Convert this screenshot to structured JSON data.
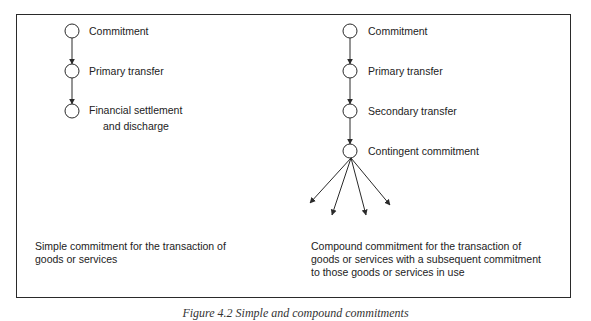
{
  "left_panel": {
    "nodes": [
      {
        "label_lines": [
          "Commitment"
        ]
      },
      {
        "label_lines": [
          "Primary transfer"
        ]
      },
      {
        "label_lines": [
          "Financial settlement",
          "and discharge"
        ]
      }
    ],
    "caption_lines": [
      "Simple commitment for the transaction of",
      "goods or services"
    ]
  },
  "right_panel": {
    "nodes": [
      {
        "label_lines": [
          "Commitment"
        ]
      },
      {
        "label_lines": [
          "Primary transfer"
        ]
      },
      {
        "label_lines": [
          "Secondary transfer"
        ]
      },
      {
        "label_lines": [
          "Contingent commitment"
        ]
      }
    ],
    "fan_out_arrow_count": 4,
    "caption_lines": [
      "Compound commitment for the transaction of",
      "goods or services with a subsequent commitment",
      "to those goods or services in use"
    ]
  },
  "figure_caption": "Figure 4.2 Simple and compound commitments",
  "colors": {
    "stroke": "#2a2a2a",
    "text": "#222222",
    "background": "#ffffff"
  }
}
